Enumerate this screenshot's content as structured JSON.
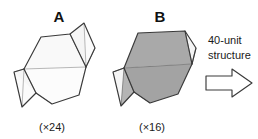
{
  "figure": {
    "background_color": "#ffffff",
    "stroke_color": "#3a3a3a",
    "thin_stroke_color": "#8c8c8c",
    "unit_a": {
      "letter": "A",
      "count_label": "(×24)",
      "fill_color": "#f7f7f7",
      "fill_color_alt": "#fbfbfb"
    },
    "unit_b": {
      "letter": "B",
      "count_label": "(×16)",
      "fill_color": "#a9a9a9",
      "fill_color_alt": "#b8b8b8",
      "fill_color_light": "#f2f2f2"
    },
    "result": {
      "line1": "40-unit",
      "line2": "structure",
      "arrow_name": "right-arrow"
    }
  }
}
